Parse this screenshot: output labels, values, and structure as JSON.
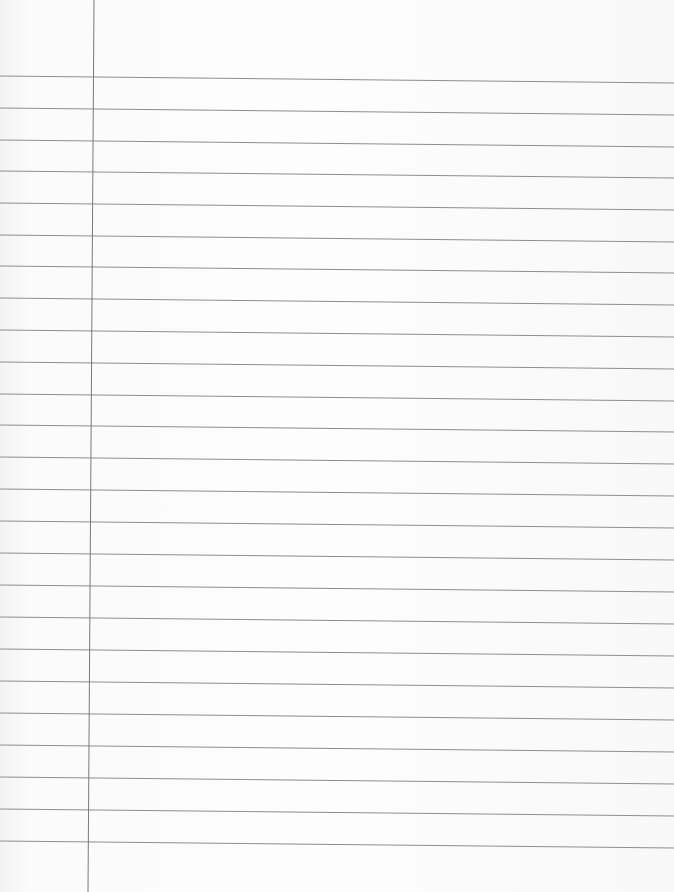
{
  "page": {
    "type": "lined-notebook-paper",
    "background": "#fbfbfb",
    "rule_color": "#8e8e8e",
    "margin_color": "#7a7a7a",
    "margin_line": {
      "x_top": 94,
      "x_bottom": 88
    },
    "rule_slope_px": 7,
    "rules_left_y": [
      76,
      108,
      140,
      171,
      203,
      235,
      266,
      298,
      330,
      362,
      394,
      425,
      457,
      489,
      521,
      553,
      585,
      617,
      649,
      681,
      713,
      745,
      777,
      809,
      841
    ],
    "text_content": []
  }
}
